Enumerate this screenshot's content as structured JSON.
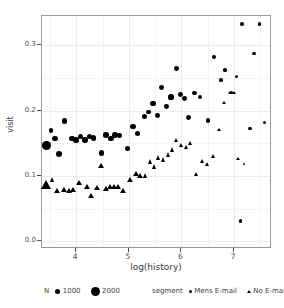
{
  "chart_data": {
    "type": "scatter",
    "title": "",
    "xlabel": "log(history)",
    "ylabel": "visit",
    "xlim": [
      3.35,
      7.72
    ],
    "ylim": [
      -0.012,
      0.345
    ],
    "xticks": [
      4,
      5,
      6,
      7
    ],
    "yticks": [
      "0.0",
      "0.1",
      "0.2",
      "0.3"
    ],
    "grid": true,
    "size_legend": {
      "title": "N",
      "levels": [
        1000,
        2000
      ]
    },
    "color_legend": {
      "title": "segment",
      "entries": [
        "Mens E-mail",
        "No E-mail"
      ]
    },
    "series": [
      {
        "name": "Mens E-mail",
        "marker": "circle",
        "points": [
          {
            "x": 3.43,
            "y": 0.147,
            "n": 2000
          },
          {
            "x": 3.52,
            "y": 0.17,
            "n": 700
          },
          {
            "x": 3.6,
            "y": 0.157,
            "n": 900
          },
          {
            "x": 3.67,
            "y": 0.133,
            "n": 1000
          },
          {
            "x": 3.78,
            "y": 0.184,
            "n": 800
          },
          {
            "x": 3.92,
            "y": 0.157,
            "n": 900
          },
          {
            "x": 4.0,
            "y": 0.155,
            "n": 900
          },
          {
            "x": 4.08,
            "y": 0.16,
            "n": 800
          },
          {
            "x": 4.17,
            "y": 0.155,
            "n": 900
          },
          {
            "x": 4.25,
            "y": 0.16,
            "n": 900
          },
          {
            "x": 4.33,
            "y": 0.158,
            "n": 900
          },
          {
            "x": 4.48,
            "y": 0.135,
            "n": 900
          },
          {
            "x": 4.57,
            "y": 0.163,
            "n": 900
          },
          {
            "x": 4.66,
            "y": 0.157,
            "n": 900
          },
          {
            "x": 4.74,
            "y": 0.163,
            "n": 900
          },
          {
            "x": 4.82,
            "y": 0.162,
            "n": 900
          },
          {
            "x": 4.97,
            "y": 0.142,
            "n": 900
          },
          {
            "x": 5.08,
            "y": 0.176,
            "n": 800
          },
          {
            "x": 5.16,
            "y": 0.165,
            "n": 800
          },
          {
            "x": 5.3,
            "y": 0.191,
            "n": 800
          },
          {
            "x": 5.38,
            "y": 0.198,
            "n": 700
          },
          {
            "x": 5.46,
            "y": 0.211,
            "n": 800
          },
          {
            "x": 5.54,
            "y": 0.192,
            "n": 700
          },
          {
            "x": 5.62,
            "y": 0.235,
            "n": 700
          },
          {
            "x": 5.72,
            "y": 0.206,
            "n": 700
          },
          {
            "x": 5.8,
            "y": 0.221,
            "n": 800
          },
          {
            "x": 5.9,
            "y": 0.265,
            "n": 700
          },
          {
            "x": 5.98,
            "y": 0.225,
            "n": 700
          },
          {
            "x": 6.06,
            "y": 0.218,
            "n": 700
          },
          {
            "x": 6.14,
            "y": 0.19,
            "n": 700
          },
          {
            "x": 6.25,
            "y": 0.227,
            "n": 600
          },
          {
            "x": 6.35,
            "y": 0.221,
            "n": 600
          },
          {
            "x": 6.5,
            "y": 0.185,
            "n": 550
          },
          {
            "x": 6.62,
            "y": 0.282,
            "n": 400
          },
          {
            "x": 6.75,
            "y": 0.247,
            "n": 350
          },
          {
            "x": 6.83,
            "y": 0.262,
            "n": 350
          },
          {
            "x": 6.95,
            "y": 0.228,
            "n": 300
          },
          {
            "x": 7.04,
            "y": 0.252,
            "n": 250
          },
          {
            "x": 7.15,
            "y": 0.333,
            "n": 250
          },
          {
            "x": 7.3,
            "y": 0.173,
            "n": 250
          },
          {
            "x": 7.38,
            "y": 0.288,
            "n": 200
          },
          {
            "x": 7.48,
            "y": 0.333,
            "n": 250
          },
          {
            "x": 7.58,
            "y": 0.182,
            "n": 250
          },
          {
            "x": 7.12,
            "y": 0.031,
            "n": 200
          }
        ]
      },
      {
        "name": "No E-mail",
        "marker": "triangle",
        "points": [
          {
            "x": 3.43,
            "y": 0.087,
            "n": 2000
          },
          {
            "x": 3.56,
            "y": 0.095,
            "n": 800
          },
          {
            "x": 3.64,
            "y": 0.077,
            "n": 900
          },
          {
            "x": 3.78,
            "y": 0.079,
            "n": 900
          },
          {
            "x": 3.86,
            "y": 0.078,
            "n": 900
          },
          {
            "x": 3.94,
            "y": 0.079,
            "n": 900
          },
          {
            "x": 4.05,
            "y": 0.089,
            "n": 900
          },
          {
            "x": 4.2,
            "y": 0.083,
            "n": 900
          },
          {
            "x": 4.28,
            "y": 0.069,
            "n": 900
          },
          {
            "x": 4.4,
            "y": 0.082,
            "n": 900
          },
          {
            "x": 4.48,
            "y": 0.115,
            "n": 900
          },
          {
            "x": 4.56,
            "y": 0.081,
            "n": 900
          },
          {
            "x": 4.64,
            "y": 0.083,
            "n": 900
          },
          {
            "x": 4.72,
            "y": 0.083,
            "n": 900
          },
          {
            "x": 4.8,
            "y": 0.083,
            "n": 900
          },
          {
            "x": 4.9,
            "y": 0.078,
            "n": 900
          },
          {
            "x": 5.02,
            "y": 0.094,
            "n": 900
          },
          {
            "x": 5.14,
            "y": 0.104,
            "n": 900
          },
          {
            "x": 5.22,
            "y": 0.101,
            "n": 900
          },
          {
            "x": 5.32,
            "y": 0.1,
            "n": 800
          },
          {
            "x": 5.42,
            "y": 0.122,
            "n": 800
          },
          {
            "x": 5.5,
            "y": 0.114,
            "n": 800
          },
          {
            "x": 5.58,
            "y": 0.128,
            "n": 800
          },
          {
            "x": 5.66,
            "y": 0.125,
            "n": 800
          },
          {
            "x": 5.76,
            "y": 0.133,
            "n": 800
          },
          {
            "x": 5.84,
            "y": 0.14,
            "n": 800
          },
          {
            "x": 5.92,
            "y": 0.155,
            "n": 700
          },
          {
            "x": 6.0,
            "y": 0.147,
            "n": 700
          },
          {
            "x": 6.1,
            "y": 0.143,
            "n": 700
          },
          {
            "x": 6.18,
            "y": 0.15,
            "n": 700
          },
          {
            "x": 6.28,
            "y": 0.103,
            "n": 600
          },
          {
            "x": 6.4,
            "y": 0.122,
            "n": 550
          },
          {
            "x": 6.5,
            "y": 0.118,
            "n": 500
          },
          {
            "x": 6.6,
            "y": 0.131,
            "n": 450
          },
          {
            "x": 6.72,
            "y": 0.17,
            "n": 400
          },
          {
            "x": 6.82,
            "y": 0.212,
            "n": 350
          },
          {
            "x": 6.92,
            "y": 0.228,
            "n": 300
          },
          {
            "x": 7.0,
            "y": 0.227,
            "n": 300
          },
          {
            "x": 7.08,
            "y": 0.126,
            "n": 300
          },
          {
            "x": 7.2,
            "y": 0.119,
            "n": 250
          }
        ]
      }
    ]
  },
  "axes": {
    "ylabel": "visit",
    "xlabel": "log(history)",
    "yticks": [
      "0.0",
      "0.1",
      "0.2",
      "0.3"
    ],
    "xticks": [
      "4",
      "5",
      "6",
      "7"
    ]
  },
  "legend": {
    "size_title": "N",
    "size_labels": [
      "1000",
      "2000"
    ],
    "segment_title": "segment",
    "segment_labels": [
      "Mens E-mail",
      "No E-mail"
    ]
  },
  "colors": {
    "marker": "#000000",
    "grid": "#ebebeb",
    "panel_border": "#9a9a9a",
    "text": "#4d4d4d"
  }
}
